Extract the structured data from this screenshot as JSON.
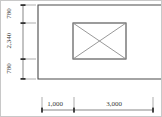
{
  "drawing": {
    "type": "architectural-plan-dimension-drawing",
    "units_implied": "mm",
    "vertical_dimensions": [
      {
        "id": "v-top",
        "label": "780",
        "value": 780
      },
      {
        "id": "v-middle",
        "label": "2,340",
        "value": 2340
      },
      {
        "id": "v-bottom",
        "label": "780",
        "value": 780
      }
    ],
    "horizontal_dimensions": [
      {
        "id": "h-left",
        "label": "1,000",
        "value": 1000
      },
      {
        "id": "h-right",
        "label": "3,000",
        "value": 3000
      }
    ],
    "colors": {
      "background": "#ffffff",
      "outline": "#4a4a4a",
      "diagonal": "#8d8d8d",
      "dimension_line": "#555555",
      "extension_line": "#777777",
      "tick": "#333333",
      "text": "#3a3a3a",
      "image_border": "#c8c8c8"
    },
    "shapes": {
      "outer_boundary": "open-rectangle-extending-right",
      "inner_element": "rectangle-with-x-diagonals"
    }
  }
}
